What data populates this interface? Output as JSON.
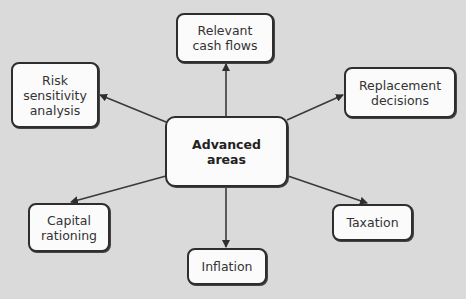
{
  "diagram": {
    "center": {
      "label": "Advanced\nareas"
    },
    "nodes": [
      {
        "id": "relevant-cash-flows",
        "label": "Relevant\ncash flows"
      },
      {
        "id": "risk-sensitivity-analysis",
        "label": "Risk\nsensitivity\nanalysis"
      },
      {
        "id": "replacement-decisions",
        "label": "Replacement\ndecisions"
      },
      {
        "id": "capital-rationing",
        "label": "Capital\nrationing"
      },
      {
        "id": "taxation",
        "label": "Taxation"
      },
      {
        "id": "inflation",
        "label": "Inflation"
      }
    ],
    "colors": {
      "background": "#dadada",
      "box_fill": "#fbfbfb",
      "stroke": "#2e2e2e"
    }
  }
}
